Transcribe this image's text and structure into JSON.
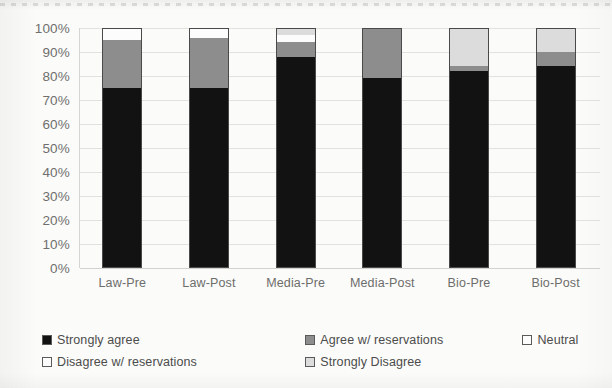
{
  "chart_data": {
    "type": "bar",
    "subtype": "stacked-bar-100-percent",
    "title": "",
    "subtitle": "",
    "xlabel": "",
    "ylabel": "",
    "categories": [
      "Law-Pre",
      "Law-Post",
      "Media-Pre",
      "Media-Post",
      "Bio-Pre",
      "Bio-Post"
    ],
    "series": [
      {
        "name": "Strongly agree",
        "color": "#121212",
        "values": [
          75,
          75,
          88,
          79,
          82,
          84
        ]
      },
      {
        "name": "Agree w/ reservations",
        "color": "#8d8d8d",
        "values": [
          20,
          21,
          6,
          21,
          2,
          6
        ]
      },
      {
        "name": "Neutral",
        "color": "#fcfcfc",
        "values": [
          5,
          4,
          3,
          0,
          0,
          0
        ]
      },
      {
        "name": "Disagree w/ reservations",
        "color": "#fcfcfc",
        "values": [
          0,
          0,
          0,
          0,
          0,
          0
        ]
      },
      {
        "name": "Strongly Disagree",
        "color": "#dcdcdc",
        "values": [
          0,
          0,
          3,
          0,
          16,
          10
        ]
      }
    ],
    "ylim": [
      0,
      100
    ],
    "yticks": [
      "0%",
      "10%",
      "20%",
      "30%",
      "40%",
      "50%",
      "60%",
      "70%",
      "80%",
      "90%",
      "100%"
    ],
    "ytick_values": [
      0,
      10,
      20,
      30,
      40,
      50,
      60,
      70,
      80,
      90,
      100
    ],
    "grid": true,
    "grid_axis": "y",
    "legend": true,
    "legend_position": "bottom-left",
    "legend_entries": [
      "Strongly agree",
      "Agree w/ reservations",
      "Neutral",
      "Disagree w/ reservations",
      "Strongly Disagree"
    ],
    "annotations": []
  },
  "style": {
    "background": "#fbfbfa",
    "grid_color": "#e2e2df",
    "axis_color": "#d5d5d2",
    "tick_text_color": "#6f6f6d",
    "legend_text_color": "#4c4c4b",
    "bar_outline_color": "#4a4a4a"
  }
}
